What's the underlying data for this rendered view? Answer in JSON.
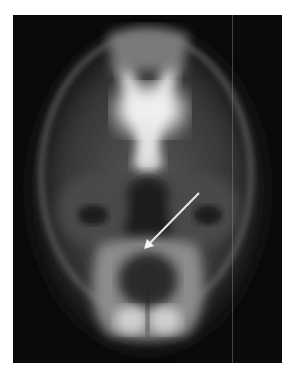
{
  "image": {
    "subject": "skull radiograph (basal view)",
    "annotation": {
      "type": "arrow",
      "color": "#e8e8e8",
      "from": [
        199,
        193
      ],
      "to": [
        144,
        249
      ]
    },
    "colors": {
      "background": "#ffffff",
      "film": "#0a0a0a",
      "bone": "#d8d8d8"
    }
  }
}
